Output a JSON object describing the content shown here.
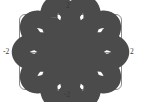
{
  "figure": {
    "name": "polar-rose-plot",
    "background_color": "#ffffff",
    "frame_color": "#8a8a8a",
    "axis_color": "#9a9a9a",
    "curve_color": "#4b4b4b"
  },
  "labels": {
    "top": "2",
    "bottom": "-2",
    "left": "-2",
    "right": "2"
  },
  "chart_data": {
    "type": "line",
    "plot_kind": "polar-rose",
    "title": "",
    "xlabel": "",
    "ylabel": "",
    "xlim": [
      -2,
      2
    ],
    "ylim": [
      -2,
      2
    ],
    "xticks": [
      -2,
      2
    ],
    "yticks": [
      -2,
      2
    ],
    "xtick_labels": [
      "-2",
      "2"
    ],
    "ytick_labels": [
      "-2",
      "2"
    ],
    "grid": false,
    "legend": null,
    "equation": "r = 2*cos(5*theta/2)",
    "petal_count": 5,
    "max_radius": 2,
    "petal_angles_deg": [
      90,
      162,
      234,
      306,
      18
    ],
    "series": [
      {
        "name": "rose",
        "color": "#4b4b4b",
        "theta_range_deg": [
          0,
          720
        ],
        "r_amplitude": 2,
        "r_frequency": 2.5
      }
    ]
  }
}
